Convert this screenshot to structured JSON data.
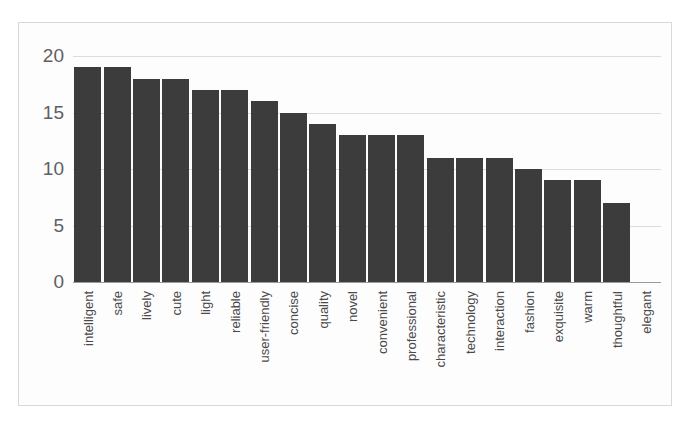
{
  "chart_data": {
    "type": "bar",
    "title": "",
    "subtitle": "",
    "xlabel": "",
    "ylabel": "",
    "ylim": [
      0,
      20
    ],
    "yticks": [
      "0",
      "5",
      "10",
      "15",
      "20"
    ],
    "grid": true,
    "legend": "none",
    "bar_color": "#3c3c3c",
    "gridline_color": "#dcdcdc",
    "axis_color": "#9a9a9a",
    "background_color": "#fdfdfd",
    "categories": [
      "intelligent",
      "safe",
      "lively",
      "cute",
      "light",
      "reliable",
      "user-friendly",
      "concise",
      "quality",
      "novel",
      "convenient",
      "professional",
      "characteristic",
      "technology",
      "interaction",
      "fashion",
      "exquisite",
      "warm",
      "thoughtful",
      "elegant"
    ],
    "values": [
      19,
      19,
      18,
      18,
      17,
      17,
      16,
      15,
      14,
      13,
      13,
      13,
      11,
      11,
      11,
      10,
      9,
      9,
      7,
      0
    ]
  }
}
